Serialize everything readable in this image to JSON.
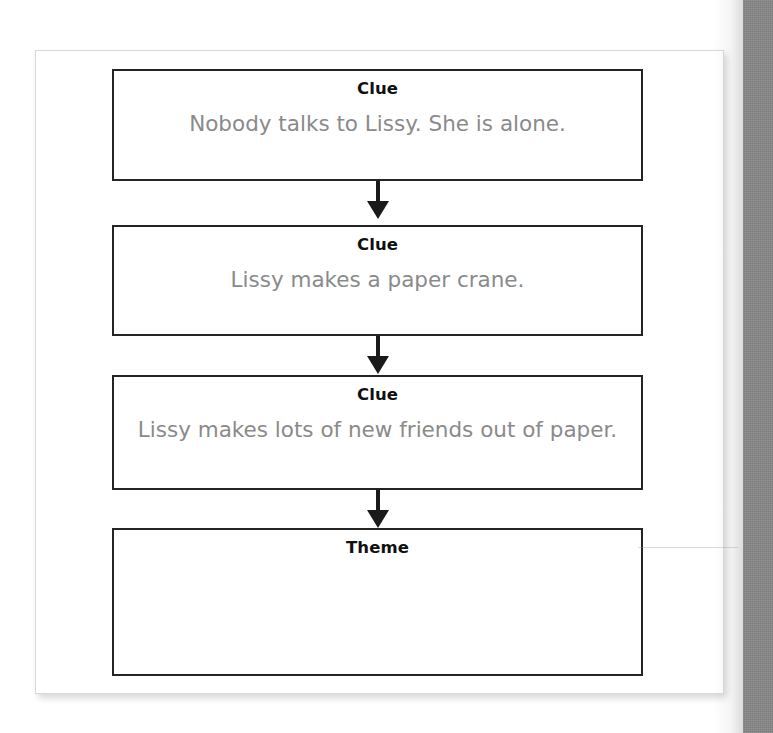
{
  "document": {
    "type": "worksheet-graphic-organizer",
    "title": "Clue and Theme Flow Chart"
  },
  "flow": {
    "nodes": [
      {
        "label": "Clue",
        "text": "Nobody talks to Lissy. She is alone."
      },
      {
        "label": "Clue",
        "text": "Lissy makes a paper crane."
      },
      {
        "label": "Clue",
        "text": "Lissy makes lots of new friends out of paper."
      },
      {
        "label": "Theme",
        "text": ""
      }
    ],
    "connectors": [
      {
        "icon": "down-arrow-icon"
      },
      {
        "icon": "down-arrow-icon"
      },
      {
        "icon": "down-arrow-icon"
      }
    ]
  },
  "colors": {
    "box_border": "#242424",
    "label_text": "#101010",
    "body_text": "#8a8a8a",
    "page_background": "#ffffff",
    "card_border": "#d9d9d9",
    "gutter_strip": "#868686",
    "arrow": "#1a1a1a"
  }
}
